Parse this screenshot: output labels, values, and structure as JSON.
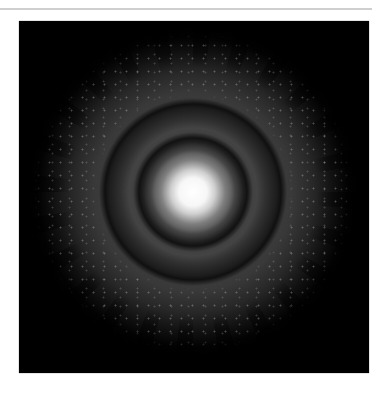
{
  "figure": {
    "colors": {
      "background": "#000000",
      "page": "#ffffff",
      "rule": "#cfcfcf",
      "core": "#ffffff"
    },
    "rings": [
      {
        "name": "central-disk",
        "radius_px": 38
      },
      {
        "name": "inner-dark-ring",
        "radius_px": 53
      },
      {
        "name": "outer-dark-ring",
        "radius_px": 88
      },
      {
        "name": "outer-halo",
        "radius_px": 150
      }
    ]
  }
}
